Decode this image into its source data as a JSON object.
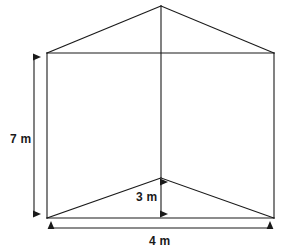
{
  "diagram": {
    "shape_name": "tent-prism",
    "stroke_color": "#1a1a1a",
    "background_color": "#ffffff",
    "labels": {
      "height": "7 m",
      "floor_height": "3 m",
      "width": "4 m"
    },
    "measurements": [
      {
        "name": "height",
        "value": 7,
        "unit": "m",
        "text": "7 m",
        "orientation": "vertical",
        "position": "left"
      },
      {
        "name": "floor_height",
        "value": 3,
        "unit": "m",
        "text": "3 m",
        "orientation": "vertical",
        "position": "center-bottom"
      },
      {
        "name": "width",
        "value": 4,
        "unit": "m",
        "text": "4 m",
        "orientation": "horizontal",
        "position": "bottom"
      }
    ],
    "vertices": {
      "apex": [
        161,
        6
      ],
      "top_left": [
        47,
        53
      ],
      "top_right": [
        274,
        53
      ],
      "bottom_left": [
        47,
        218
      ],
      "bottom_right": [
        274,
        218
      ],
      "floor_center": [
        161,
        178
      ]
    }
  }
}
